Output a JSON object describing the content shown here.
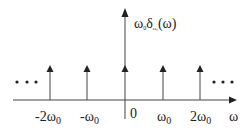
{
  "diagram": {
    "y_label": {
      "main": "ω",
      "sub0": "0",
      "delta": "δ",
      "delta_sub": "ω₀",
      "arg": "(ω)"
    },
    "x_label": "ω",
    "ellipsis_left": "• • •",
    "ellipsis_right": "• • •",
    "impulses": [
      {
        "position": -2,
        "label": "-2ω",
        "sub": "0"
      },
      {
        "position": -1,
        "label": "-ω",
        "sub": "0"
      },
      {
        "position": 0,
        "label": "0",
        "sub": ""
      },
      {
        "position": 1,
        "label": "ω",
        "sub": "0"
      },
      {
        "position": 2,
        "label": "2ω",
        "sub": "0"
      }
    ],
    "line_color": "#333333"
  }
}
